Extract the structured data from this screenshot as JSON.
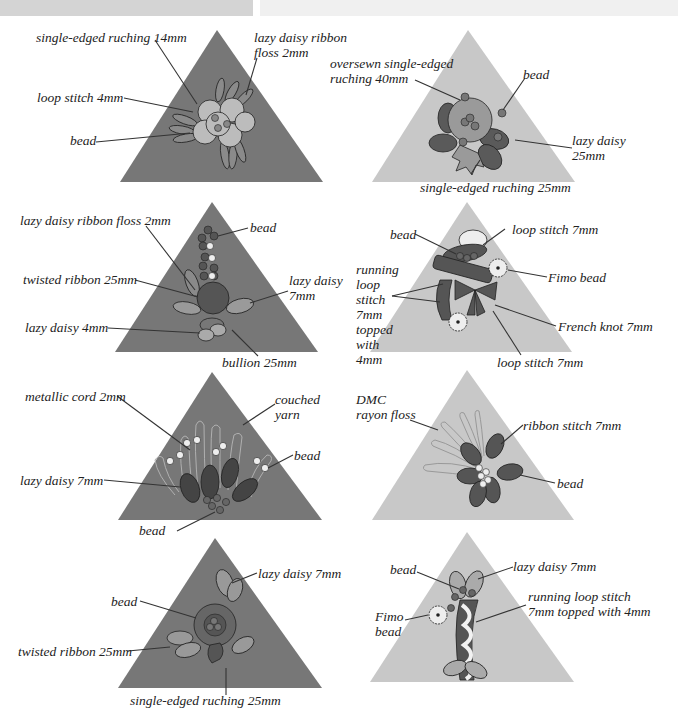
{
  "colors": {
    "dark_triangle": "#777777",
    "light_triangle": "#c8c8c8",
    "topbar_left": "#d4d4d4",
    "topbar_right": "#f0f0f0",
    "text": "#222222"
  },
  "panels": [
    {
      "id": "left-1",
      "triangle": "dark",
      "labels": [
        "single-edged ruching 14mm",
        "lazy daisy ribbon\nfloss 2mm",
        "loop stitch 4mm",
        "bead"
      ]
    },
    {
      "id": "right-1",
      "triangle": "light",
      "labels": [
        "oversewn single-edged\nruching 40mm",
        "bead",
        "lazy daisy\n25mm",
        "single-edged ruching 25mm"
      ]
    },
    {
      "id": "left-2",
      "triangle": "dark",
      "labels": [
        "lazy daisy ribbon floss 2mm",
        "bead",
        "twisted ribbon 25mm",
        "lazy daisy\n7mm",
        "lazy daisy 4mm",
        "bullion 25mm"
      ]
    },
    {
      "id": "right-2",
      "triangle": "light",
      "labels": [
        "bead",
        "loop stitch 7mm",
        "running\nloop\nstitch\n7mm\ntopped\nwith\n4mm",
        "Fimo bead",
        "French knot 7mm",
        "loop stitch 7mm"
      ]
    },
    {
      "id": "left-3",
      "triangle": "dark",
      "labels": [
        "metallic cord 2mm",
        "couched\nyarn",
        "bead",
        "lazy daisy 7mm",
        "bead"
      ]
    },
    {
      "id": "right-3",
      "triangle": "light",
      "labels": [
        "DMC\nrayon floss",
        "ribbon stitch 7mm",
        "bead"
      ]
    },
    {
      "id": "left-4",
      "triangle": "dark",
      "labels": [
        "lazy daisy 7mm",
        "bead",
        "twisted ribbon 25mm",
        "single-edged ruching 25mm"
      ]
    },
    {
      "id": "right-4",
      "triangle": "light",
      "labels": [
        "bead",
        "lazy daisy 7mm",
        "running loop stitch\n7mm topped with 4mm",
        "Fimo\nbead"
      ]
    }
  ]
}
